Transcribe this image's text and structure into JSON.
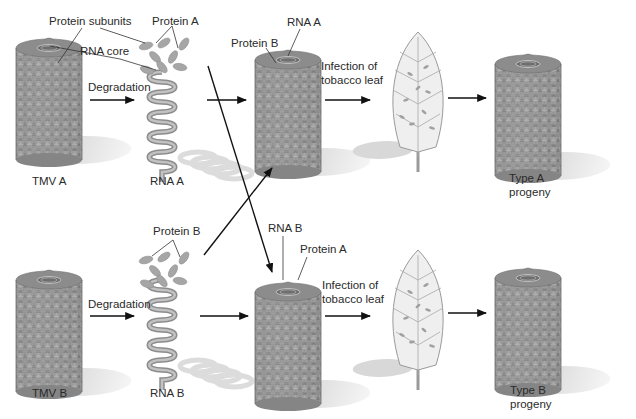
{
  "colors": {
    "scale_fill": "#8f8f8f",
    "scale_light": "#b5b5b5",
    "scale_edge": "#6a6a6a",
    "rna_coil": "#a9a9a9",
    "shadow": "#d9d9d9",
    "leaf_fill": "#eeeeee",
    "leaf_vein": "#9c9c9c",
    "arrow": "#111111",
    "text": "#2a2a2a"
  },
  "top_row": {
    "virus": {
      "label": "TMV A",
      "callouts": [
        "Protein subunits",
        "RNA core"
      ]
    },
    "step_degradation": "Degradation",
    "protein_label": "Protein A",
    "rna_label": "RNA A",
    "hybrid": {
      "rna_label": "RNA A",
      "protein_label": "Protein B"
    },
    "infection_label_line1": "Infection of",
    "infection_label_line2": "tobacco leaf",
    "progeny_line1": "Type A",
    "progeny_line2": "progeny"
  },
  "bottom_row": {
    "virus": {
      "label": "TMV B"
    },
    "step_degradation": "Degradation",
    "protein_label": "Protein B",
    "rna_label": "RNA B",
    "hybrid": {
      "rna_label": "RNA B",
      "protein_label": "Protein A"
    },
    "infection_label_line1": "Infection of",
    "infection_label_line2": "tobacco leaf",
    "progeny_line1": "Type B",
    "progeny_line2": "progeny"
  }
}
